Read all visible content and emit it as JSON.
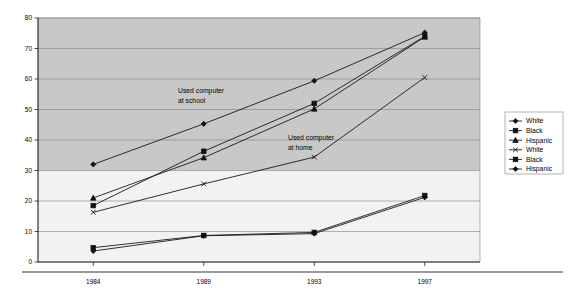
{
  "chart_data": {
    "type": "line",
    "title": "",
    "subtitle": "",
    "xlabel": "",
    "ylabel": "",
    "categories": [
      "1984",
      "1989",
      "1993",
      "1997"
    ],
    "x": [
      1984,
      1989,
      1993,
      1997
    ],
    "ylim": [
      0,
      80
    ],
    "yticks": [
      0,
      10,
      20,
      30,
      40,
      50,
      60,
      70,
      80
    ],
    "ytick_labels": [
      "0",
      "10",
      "20",
      "30",
      "40",
      "50",
      "60",
      "70",
      "80"
    ],
    "xtick_labels": [
      "1984",
      "1989",
      "1993",
      "1997"
    ],
    "grid": true,
    "grid_axis": "y",
    "legend_position": "right",
    "legend_entries": [
      {
        "label": "White",
        "marker": "diamond",
        "group": "school"
      },
      {
        "label": "Black",
        "marker": "square",
        "group": "school"
      },
      {
        "label": "Hispanic",
        "marker": "triangle",
        "group": "school"
      },
      {
        "label": "White",
        "marker": "x",
        "group": "home"
      },
      {
        "label": "Black",
        "marker": "square",
        "group": "home"
      },
      {
        "label": "Hispanic",
        "marker": "diamond",
        "group": "home"
      }
    ],
    "series": [
      {
        "name": "White",
        "group": "school",
        "marker": "diamond",
        "values": [
          32.0,
          45.3,
          59.4,
          75.2
        ]
      },
      {
        "name": "Black",
        "group": "school",
        "marker": "square",
        "values": [
          18.5,
          36.3,
          52.0,
          74.0
        ]
      },
      {
        "name": "Hispanic",
        "group": "school",
        "marker": "triangle",
        "values": [
          21.0,
          34.2,
          50.2,
          73.8
        ]
      },
      {
        "name": "White",
        "group": "home",
        "marker": "x",
        "values": [
          16.3,
          25.6,
          34.4,
          60.5
        ]
      },
      {
        "name": "Black",
        "group": "home",
        "marker": "square",
        "values": [
          4.7,
          8.7,
          9.7,
          21.8
        ]
      },
      {
        "name": "Hispanic",
        "group": "home",
        "marker": "diamond",
        "values": [
          3.6,
          8.6,
          9.3,
          21.2
        ]
      }
    ],
    "annotations": [
      {
        "name": "used-computer-at-school",
        "line1": "Used computer",
        "line2": "at school"
      },
      {
        "name": "used-computer-at-home",
        "line1": "Used computer",
        "line2": "at home"
      }
    ],
    "colors": {
      "series": "#1a1a1a",
      "grid": "#808080",
      "axis": "#000000",
      "plot_background_upper": "#c8c8c8",
      "plot_background_lower": "#f2f2f2",
      "page_background": "#ffffff"
    },
    "background_band_threshold": 30
  }
}
